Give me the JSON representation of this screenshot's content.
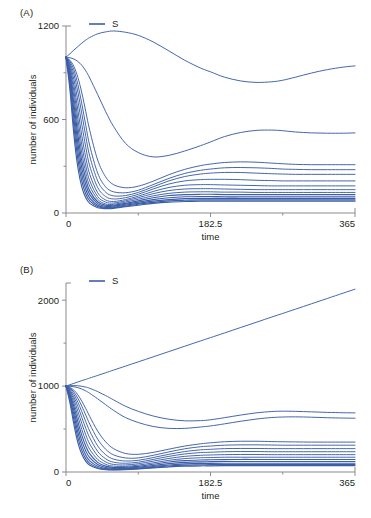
{
  "figure": {
    "panel_a_label": "(A)",
    "panel_b_label": "(B)"
  },
  "chart_data": [
    {
      "id": "panel-a",
      "type": "line",
      "title": "(A)",
      "xlabel": "time",
      "ylabel": "number of individuals",
      "xlim": [
        0,
        365
      ],
      "ylim": [
        0,
        1200
      ],
      "xticks": [
        0,
        182.5,
        365
      ],
      "xtick_labels": [
        "0",
        "182.5",
        "365"
      ],
      "xticks_minor": [
        91.25,
        273.75
      ],
      "yticks": [
        0,
        600,
        1200
      ],
      "ytick_labels": [
        "0",
        "600",
        "1200"
      ],
      "yticks_minor": [
        300,
        900
      ],
      "grid": false,
      "legend": {
        "position": "top-left-inside",
        "entries": [
          {
            "label": "S",
            "color": "#3c5ea6"
          }
        ]
      },
      "line_color": "#3c5ea6",
      "x": [
        0,
        5,
        10,
        15,
        20,
        25,
        30,
        40,
        50,
        60,
        75,
        91.25,
        110,
        130,
        150,
        170,
        182.5,
        200,
        220,
        240,
        260,
        273.75,
        290,
        310,
        330,
        350,
        365
      ],
      "series": [
        {
          "name": "S1",
          "values": [
            1000,
            1022,
            1046,
            1068,
            1090,
            1110,
            1126,
            1150,
            1162,
            1168,
            1160,
            1140,
            1098,
            1040,
            980,
            930,
            906,
            872,
            848,
            838,
            842,
            852,
            872,
            898,
            920,
            936,
            944
          ]
        },
        {
          "name": "S2",
          "values": [
            1000,
            996,
            988,
            972,
            948,
            912,
            866,
            760,
            652,
            556,
            448,
            388,
            360,
            370,
            398,
            432,
            456,
            490,
            516,
            530,
            532,
            528,
            520,
            514,
            512,
            512,
            514
          ]
        },
        {
          "name": "S3",
          "values": [
            1000,
            980,
            940,
            870,
            770,
            650,
            530,
            340,
            232,
            182,
            162,
            172,
            204,
            246,
            280,
            304,
            314,
            324,
            328,
            326,
            320,
            316,
            312,
            310,
            310,
            310,
            310
          ]
        },
        {
          "name": "S4",
          "values": [
            1000,
            972,
            918,
            824,
            700,
            562,
            432,
            256,
            168,
            136,
            130,
            146,
            182,
            222,
            254,
            274,
            282,
            290,
            292,
            290,
            286,
            282,
            280,
            278,
            278,
            278,
            278
          ]
        },
        {
          "name": "S5",
          "values": [
            1000,
            962,
            890,
            776,
            636,
            492,
            364,
            206,
            134,
            110,
            112,
            132,
            168,
            206,
            234,
            250,
            256,
            260,
            260,
            256,
            252,
            250,
            248,
            248,
            248,
            248,
            248
          ]
        },
        {
          "name": "S6",
          "values": [
            1000,
            950,
            856,
            720,
            566,
            422,
            302,
            164,
            106,
            90,
            98,
            120,
            154,
            186,
            206,
            214,
            216,
            216,
            214,
            210,
            208,
            206,
            206,
            206,
            206,
            206,
            206
          ]
        },
        {
          "name": "S7",
          "values": [
            1000,
            936,
            818,
            660,
            496,
            356,
            248,
            130,
            84,
            74,
            86,
            108,
            138,
            164,
            178,
            182,
            182,
            180,
            178,
            176,
            174,
            174,
            174,
            174,
            174,
            174,
            174
          ]
        },
        {
          "name": "S8",
          "values": [
            1000,
            922,
            780,
            604,
            436,
            302,
            206,
            106,
            70,
            64,
            78,
            98,
            124,
            144,
            154,
            156,
            156,
            154,
            152,
            150,
            150,
            150,
            150,
            150,
            150,
            150,
            150
          ]
        },
        {
          "name": "S9",
          "values": [
            1000,
            906,
            740,
            552,
            384,
            258,
            172,
            88,
            58,
            56,
            70,
            88,
            110,
            126,
            134,
            136,
            136,
            134,
            134,
            132,
            132,
            132,
            132,
            132,
            132,
            132,
            132
          ]
        },
        {
          "name": "S10",
          "values": [
            1000,
            888,
            698,
            500,
            334,
            218,
            142,
            72,
            50,
            50,
            62,
            78,
            98,
            112,
            118,
            120,
            120,
            118,
            118,
            118,
            118,
            118,
            118,
            118,
            118,
            118,
            118
          ]
        },
        {
          "name": "S11",
          "values": [
            1000,
            868,
            654,
            448,
            288,
            182,
            118,
            60,
            42,
            44,
            56,
            70,
            86,
            98,
            104,
            106,
            106,
            104,
            104,
            104,
            104,
            104,
            104,
            104,
            104,
            104,
            104
          ]
        },
        {
          "name": "S12",
          "values": [
            1000,
            846,
            606,
            396,
            244,
            150,
            96,
            50,
            36,
            38,
            50,
            62,
            76,
            86,
            92,
            94,
            94,
            94,
            94,
            94,
            94,
            94,
            94,
            94,
            94,
            94,
            94
          ]
        },
        {
          "name": "S13",
          "values": [
            1000,
            820,
            556,
            344,
            204,
            122,
            78,
            42,
            32,
            34,
            44,
            56,
            68,
            78,
            82,
            84,
            84,
            84,
            84,
            84,
            84,
            84,
            84,
            84,
            84,
            84,
            84
          ]
        },
        {
          "name": "S14",
          "values": [
            1000,
            790,
            500,
            292,
            166,
            98,
            62,
            34,
            28,
            30,
            40,
            50,
            62,
            70,
            74,
            76,
            76,
            76,
            76,
            76,
            76,
            76,
            76,
            76,
            76,
            76,
            76
          ]
        }
      ]
    },
    {
      "id": "panel-b",
      "type": "line",
      "title": "(B)",
      "xlabel": "time",
      "ylabel": "number of individuals",
      "xlim": [
        0,
        365
      ],
      "ylim": [
        0,
        2200
      ],
      "xticks": [
        0,
        182.5,
        365
      ],
      "xtick_labels": [
        "0",
        "182.5",
        "365"
      ],
      "xticks_minor": [
        91.25,
        273.75
      ],
      "yticks": [
        0,
        1000,
        2000
      ],
      "ytick_labels": [
        "0",
        "1000",
        "2000"
      ],
      "yticks_minor": [
        500,
        1500
      ],
      "grid": false,
      "legend": {
        "position": "top-left-inside",
        "entries": [
          {
            "label": "S",
            "color": "#3c5ea6"
          }
        ]
      },
      "line_color": "#3c5ea6",
      "x": [
        0,
        5,
        10,
        15,
        20,
        25,
        30,
        40,
        50,
        60,
        75,
        91.25,
        110,
        130,
        150,
        170,
        182.5,
        200,
        220,
        240,
        260,
        273.75,
        290,
        310,
        330,
        350,
        365
      ],
      "series": [
        {
          "name": "S1",
          "values": [
            1000,
            1016,
            1032,
            1048,
            1064,
            1078,
            1094,
            1124,
            1155,
            1186,
            1232,
            1282,
            1340,
            1402,
            1464,
            1526,
            1564,
            1618,
            1680,
            1742,
            1804,
            1846,
            1896,
            1958,
            2020,
            2082,
            2128
          ]
        },
        {
          "name": "S2",
          "values": [
            1000,
            1004,
            1006,
            1004,
            998,
            988,
            974,
            936,
            890,
            840,
            766,
            706,
            652,
            614,
            596,
            598,
            608,
            632,
            662,
            688,
            704,
            708,
            706,
            700,
            694,
            690,
            688
          ]
        },
        {
          "name": "S3",
          "values": [
            1000,
            998,
            992,
            982,
            966,
            944,
            916,
            852,
            784,
            718,
            634,
            576,
            530,
            508,
            508,
            524,
            536,
            560,
            590,
            616,
            634,
            640,
            642,
            638,
            632,
            628,
            626
          ]
        },
        {
          "name": "S4",
          "values": [
            1000,
            984,
            952,
            898,
            824,
            738,
            646,
            476,
            352,
            272,
            216,
            206,
            228,
            266,
            302,
            328,
            340,
            352,
            358,
            358,
            354,
            352,
            350,
            348,
            348,
            348,
            348
          ]
        },
        {
          "name": "S5",
          "values": [
            1000,
            976,
            930,
            858,
            766,
            662,
            558,
            382,
            266,
            200,
            164,
            164,
            194,
            234,
            270,
            294,
            302,
            312,
            316,
            316,
            314,
            312,
            312,
            312,
            312,
            312,
            312
          ]
        },
        {
          "name": "S6",
          "values": [
            1000,
            966,
            904,
            812,
            702,
            586,
            476,
            304,
            202,
            150,
            128,
            136,
            168,
            206,
            238,
            258,
            264,
            272,
            274,
            274,
            272,
            272,
            272,
            272,
            272,
            272,
            272
          ]
        },
        {
          "name": "S7",
          "values": [
            1000,
            954,
            874,
            762,
            634,
            508,
            398,
            240,
            154,
            114,
            102,
            114,
            146,
            182,
            210,
            226,
            230,
            236,
            238,
            238,
            236,
            236,
            236,
            236,
            236,
            236,
            236
          ]
        },
        {
          "name": "S8",
          "values": [
            1000,
            940,
            840,
            706,
            564,
            432,
            326,
            188,
            118,
            88,
            82,
            96,
            126,
            158,
            182,
            194,
            198,
            202,
            204,
            204,
            202,
            202,
            202,
            202,
            202,
            202,
            202
          ]
        },
        {
          "name": "S9",
          "values": [
            1000,
            924,
            802,
            648,
            494,
            362,
            264,
            146,
            90,
            68,
            66,
            80,
            106,
            136,
            156,
            166,
            168,
            172,
            172,
            172,
            172,
            172,
            172,
            172,
            172,
            172,
            172
          ]
        },
        {
          "name": "S10",
          "values": [
            1000,
            906,
            760,
            586,
            426,
            300,
            210,
            112,
            68,
            52,
            54,
            66,
            90,
            116,
            132,
            140,
            142,
            144,
            146,
            146,
            146,
            146,
            146,
            146,
            146,
            146,
            146
          ]
        },
        {
          "name": "S11",
          "values": [
            1000,
            886,
            714,
            524,
            362,
            244,
            166,
            86,
            52,
            42,
            44,
            56,
            76,
            98,
            112,
            118,
            120,
            122,
            122,
            122,
            122,
            122,
            122,
            122,
            122,
            122,
            122
          ]
        },
        {
          "name": "S12",
          "values": [
            1000,
            862,
            664,
            462,
            304,
            196,
            130,
            66,
            40,
            34,
            38,
            48,
            64,
            82,
            94,
            100,
            100,
            102,
            102,
            102,
            102,
            102,
            102,
            102,
            102,
            102,
            102
          ]
        },
        {
          "name": "S13",
          "values": [
            1000,
            836,
            610,
            400,
            252,
            156,
            100,
            50,
            32,
            28,
            32,
            40,
            54,
            70,
            80,
            84,
            86,
            86,
            86,
            86,
            86,
            86,
            86,
            86,
            86,
            86,
            86
          ]
        },
        {
          "name": "S14",
          "values": [
            1000,
            806,
            552,
            342,
            206,
            124,
            78,
            40,
            26,
            24,
            28,
            36,
            48,
            60,
            68,
            72,
            72,
            74,
            74,
            74,
            74,
            74,
            74,
            74,
            74,
            74,
            74
          ]
        }
      ]
    }
  ]
}
